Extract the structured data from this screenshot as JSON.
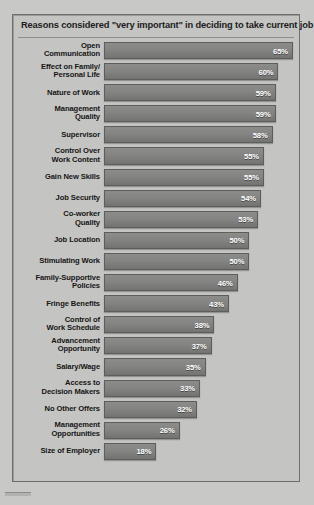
{
  "chart_data": {
    "type": "bar",
    "title": "Reasons considered \"very important\" in deciding to take current job",
    "xlabel": "",
    "ylabel": "",
    "xlim": [
      0,
      65
    ],
    "grid": false,
    "legend": null,
    "orientation": "horizontal",
    "value_suffix": "%",
    "categories": [
      "Open Communication",
      "Effect on Family/ Personal Life",
      "Nature of Work",
      "Management Quality",
      "Supervisor",
      "Control Over Work Content",
      "Gain New Skills",
      "Job Security",
      "Co-worker Quality",
      "Job Location",
      "Stimulating Work",
      "Family-Supportive Policies",
      "Fringe Benefits",
      "Control of Work Schedule",
      "Advancement Opportunity",
      "Salary/Wage",
      "Access to Decision Makers",
      "No Other Offers",
      "Management Opportunities",
      "Size of Employer"
    ],
    "values": [
      65,
      60,
      59,
      59,
      58,
      55,
      55,
      54,
      53,
      50,
      50,
      46,
      43,
      38,
      37,
      35,
      33,
      32,
      26,
      18
    ],
    "bars": [
      {
        "label_lines": [
          "Open",
          "Communication"
        ],
        "value": 65,
        "value_label": "65%"
      },
      {
        "label_lines": [
          "Effect on Family/",
          "Personal Life"
        ],
        "value": 60,
        "value_label": "60%"
      },
      {
        "label_lines": [
          "Nature of Work"
        ],
        "value": 59,
        "value_label": "59%"
      },
      {
        "label_lines": [
          "Management",
          "Quality"
        ],
        "value": 59,
        "value_label": "59%"
      },
      {
        "label_lines": [
          "Supervisor"
        ],
        "value": 58,
        "value_label": "58%"
      },
      {
        "label_lines": [
          "Control Over",
          "Work Content"
        ],
        "value": 55,
        "value_label": "55%"
      },
      {
        "label_lines": [
          "Gain New Skills"
        ],
        "value": 55,
        "value_label": "55%"
      },
      {
        "label_lines": [
          "Job Security"
        ],
        "value": 54,
        "value_label": "54%"
      },
      {
        "label_lines": [
          "Co-worker",
          "Quality"
        ],
        "value": 53,
        "value_label": "53%"
      },
      {
        "label_lines": [
          "Job Location"
        ],
        "value": 50,
        "value_label": "50%"
      },
      {
        "label_lines": [
          "Stimulating Work"
        ],
        "value": 50,
        "value_label": "50%"
      },
      {
        "label_lines": [
          "Family-Supportive",
          "Policies"
        ],
        "value": 46,
        "value_label": "46%"
      },
      {
        "label_lines": [
          "Fringe Benefits"
        ],
        "value": 43,
        "value_label": "43%"
      },
      {
        "label_lines": [
          "Control of",
          "Work Schedule"
        ],
        "value": 38,
        "value_label": "38%"
      },
      {
        "label_lines": [
          "Advancement",
          "Opportunity"
        ],
        "value": 37,
        "value_label": "37%"
      },
      {
        "label_lines": [
          "Salary/Wage"
        ],
        "value": 35,
        "value_label": "35%"
      },
      {
        "label_lines": [
          "Access to",
          "Decision Makers"
        ],
        "value": 33,
        "value_label": "33%"
      },
      {
        "label_lines": [
          "No Other Offers"
        ],
        "value": 32,
        "value_label": "32%"
      },
      {
        "label_lines": [
          "Management",
          "Opportunities"
        ],
        "value": 26,
        "value_label": "26%"
      },
      {
        "label_lines": [
          "Size of Employer"
        ],
        "value": 18,
        "value_label": "18%"
      }
    ],
    "colors": {
      "bar_fill": "#848482",
      "bar_border": "#5d5d5b",
      "panel_background": "#c4c4c2",
      "page_background": "#c8c8c6",
      "title_text": "#1c1c1c",
      "label_text": "#161616",
      "value_text": "#ffffff"
    }
  }
}
